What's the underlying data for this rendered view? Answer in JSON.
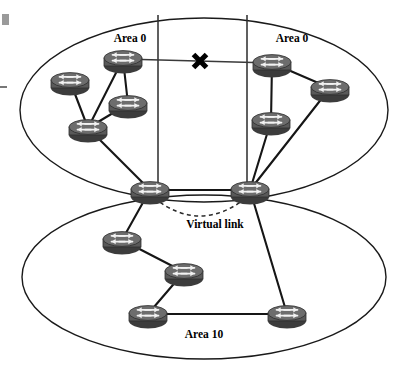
{
  "diagram": {
    "kind": "network-topology",
    "title_text": "",
    "background_color": "#ffffff",
    "router_color": "#595959",
    "line_color": "#161616",
    "break_marker_color": "#000000",
    "labels": {
      "area_left": "Area 0",
      "area_right": "Area 0",
      "area_bottom": "Area 10",
      "virtual_link": "Virtual link"
    },
    "areas": [
      {
        "id": "area-0-backbone",
        "label": "Area 0",
        "shape": "ellipse",
        "cx": 204,
        "cy": 110,
        "rx": 184,
        "ry": 92,
        "label_x": 130,
        "label_y": 42
      },
      {
        "id": "area-10-stub",
        "label": "Area 10",
        "shape": "ellipse",
        "cx": 204,
        "cy": 277,
        "rx": 182,
        "ry": 82,
        "label_x": 204,
        "label_y": 338
      }
    ],
    "boundaries": [
      {
        "id": "partition-line-left",
        "x1": 158,
        "y1": 15,
        "x2": 158,
        "y2": 192
      },
      {
        "id": "partition-line-right",
        "x1": 247,
        "y1": 15,
        "x2": 247,
        "y2": 192
      }
    ],
    "routers": [
      {
        "id": "r1",
        "name": "router-left-top",
        "x": 123,
        "y": 59,
        "area": "area-0-left"
      },
      {
        "id": "r2",
        "name": "router-left-west",
        "x": 70,
        "y": 81,
        "area": "area-0-left"
      },
      {
        "id": "r3",
        "name": "router-left-mid",
        "x": 128,
        "y": 104,
        "area": "area-0-left"
      },
      {
        "id": "r4",
        "name": "router-left-south",
        "x": 88,
        "y": 128,
        "area": "area-0-left"
      },
      {
        "id": "r5",
        "name": "router-abr-left",
        "x": 150,
        "y": 190,
        "area": "abr"
      },
      {
        "id": "r6",
        "name": "router-right-top",
        "x": 272,
        "y": 63,
        "area": "area-0-right"
      },
      {
        "id": "r7",
        "name": "router-right-east",
        "x": 330,
        "y": 88,
        "area": "area-0-right"
      },
      {
        "id": "r8",
        "name": "router-right-mid",
        "x": 271,
        "y": 121,
        "area": "area-0-right"
      },
      {
        "id": "r9",
        "name": "router-abr-right",
        "x": 250,
        "y": 190,
        "area": "abr"
      },
      {
        "id": "r10",
        "name": "router-area10-north",
        "x": 122,
        "y": 240,
        "area": "area-10"
      },
      {
        "id": "r11",
        "name": "router-area10-center",
        "x": 184,
        "y": 272,
        "area": "area-10"
      },
      {
        "id": "r12",
        "name": "router-area10-west",
        "x": 148,
        "y": 314,
        "area": "area-10"
      },
      {
        "id": "r13",
        "name": "router-area10-east",
        "x": 287,
        "y": 314,
        "area": "area-10"
      }
    ],
    "links": [
      {
        "id": "l1",
        "from": "r1",
        "to": "r3",
        "style": "solid"
      },
      {
        "id": "l2",
        "from": "r1",
        "to": "r4",
        "style": "solid"
      },
      {
        "id": "l3",
        "from": "r2",
        "to": "r4",
        "style": "solid"
      },
      {
        "id": "l4",
        "from": "r3",
        "to": "r4",
        "style": "solid"
      },
      {
        "id": "l5",
        "from": "r4",
        "to": "r5",
        "style": "solid"
      },
      {
        "id": "l6",
        "from": "r6",
        "to": "r8",
        "style": "solid"
      },
      {
        "id": "l7",
        "from": "r6",
        "to": "r7",
        "style": "solid"
      },
      {
        "id": "l8",
        "from": "r7",
        "to": "r9",
        "style": "solid"
      },
      {
        "id": "l9",
        "from": "r8",
        "to": "r9",
        "style": "solid"
      },
      {
        "id": "l10",
        "from": "r5",
        "to": "r9",
        "style": "solid"
      },
      {
        "id": "l11",
        "from": "r5",
        "to": "r10",
        "style": "solid"
      },
      {
        "id": "l12",
        "from": "r10",
        "to": "r11",
        "style": "solid"
      },
      {
        "id": "l13",
        "from": "r11",
        "to": "r12",
        "style": "solid"
      },
      {
        "id": "l14",
        "from": "r12",
        "to": "r13",
        "style": "solid"
      },
      {
        "id": "l15",
        "from": "r9",
        "to": "r13",
        "style": "solid"
      }
    ],
    "broken_link": {
      "id": "broken-backbone-link",
      "from": "r1",
      "to": "r6",
      "style": "thin",
      "marker": "x",
      "marker_x": 200,
      "marker_y": 61,
      "marker_size": 13
    },
    "virtual_link": {
      "id": "virtual-link-arc",
      "from": "r5",
      "to": "r9",
      "style": "dashed",
      "label": "Virtual link",
      "label_x": 215,
      "label_y": 228,
      "arc_sag": 22
    },
    "artifacts": [
      {
        "id": "scan-square",
        "x": 2,
        "y": 14,
        "w": 7,
        "h": 11
      },
      {
        "id": "scan-dash",
        "x": 0,
        "y": 86,
        "w": 7,
        "h": 2
      }
    ]
  }
}
